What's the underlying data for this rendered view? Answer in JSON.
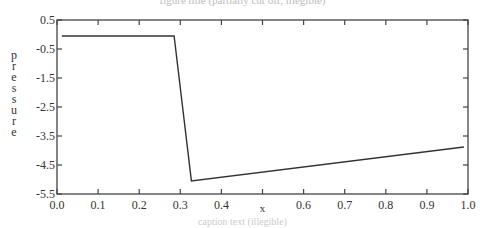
{
  "title": "figure title (partially cut off, illegible)",
  "caption": "caption text (illegible)",
  "chart_data": {
    "type": "line",
    "title": "",
    "xlabel": "x",
    "ylabel": "pressure",
    "xlim": [
      0.0,
      1.0
    ],
    "ylim": [
      -5.5,
      0.5
    ],
    "grid": false,
    "legend": null,
    "x_ticks": [
      "0.0",
      "0.1",
      "0.2",
      "0.3",
      "0.4",
      "x",
      "0.6",
      "0.7",
      "0.8",
      "0.9",
      "1.0"
    ],
    "x_tick_values": [
      0.0,
      0.1,
      0.2,
      0.3,
      0.4,
      0.5,
      0.6,
      0.7,
      0.8,
      0.9,
      1.0
    ],
    "y_ticks": [
      "0.5",
      "-0.5",
      "-1.5",
      "-2.5",
      "-3.5",
      "-4.5",
      "-5.5"
    ],
    "y_tick_values": [
      0.5,
      -0.5,
      -1.5,
      -2.5,
      -3.5,
      -4.5,
      -5.5
    ],
    "series": [
      {
        "name": "pressure",
        "color": "#333333",
        "x": [
          0.012,
          0.285,
          0.327,
          0.99
        ],
        "y": [
          -0.05,
          -0.05,
          -5.05,
          -3.88
        ]
      }
    ]
  }
}
